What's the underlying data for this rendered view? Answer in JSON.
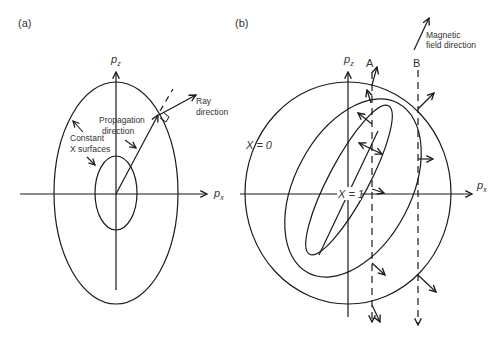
{
  "panel_a": {
    "label": "(a)",
    "axis_x": "p",
    "axis_x_sub": "x",
    "axis_z": "p",
    "axis_z_sub": "z",
    "annotations": {
      "propagation_line1": "Propagation",
      "propagation_line2": "direction",
      "ray_line1": "Ray",
      "ray_line2": "direction",
      "constant_line1": "Constant",
      "constant_line2": "X surfaces"
    }
  },
  "panel_b": {
    "label": "(b)",
    "axis_x": "p",
    "axis_x_sub": "x",
    "axis_z": "p",
    "axis_z_sub": "z",
    "line_a": "A",
    "line_b": "B",
    "x0_label": "X = 0",
    "x1_label": "X = 1",
    "magnetic_line1": "Magnetic",
    "magnetic_line2": "field direction"
  },
  "colors": {
    "stroke": "#1a1a1a",
    "text": "#333333",
    "background": "#ffffff"
  }
}
